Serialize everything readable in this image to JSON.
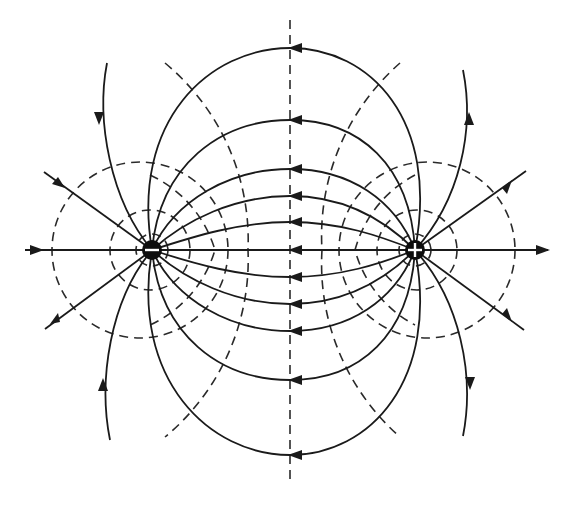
{
  "diagram": {
    "charges": [
      {
        "name": "negative-charge",
        "sign": "-",
        "x": 152,
        "y": 250,
        "r": 10
      },
      {
        "name": "positive-charge",
        "sign": "+",
        "x": 415,
        "y": 250,
        "r": 10
      }
    ],
    "axis": {
      "y": 250,
      "x_start": 25,
      "x_end": 548
    },
    "center_line": {
      "x": 290,
      "y_start": 20,
      "y_end": 485
    },
    "field_lines_between": [
      {
        "y_mid": 48
      },
      {
        "y_mid": 120
      },
      {
        "y_mid": 169
      },
      {
        "y_mid": 196
      },
      {
        "y_mid": 222
      },
      {
        "y_mid": 277
      },
      {
        "y_mid": 304
      },
      {
        "y_mid": 331
      },
      {
        "y_mid": 380
      },
      {
        "y_mid": 455
      }
    ],
    "legend": {
      "solid": "field lines",
      "dashed": "equipotential lines",
      "arrow_direction": "from + to -"
    },
    "colors": {
      "line": "#1a1a1a",
      "background": "#ffffff"
    }
  }
}
